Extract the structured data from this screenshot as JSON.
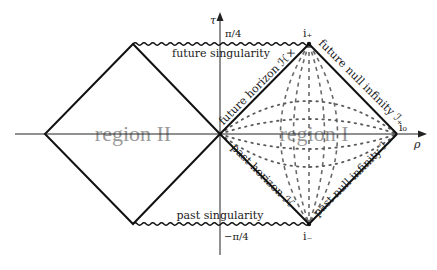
{
  "figure": {
    "axes": {
      "tau_label": "τ",
      "rho_label": "ρ",
      "tau_top_tick": "π/4",
      "tau_bottom_tick": "−π/4"
    },
    "points": {
      "i_plus": "i₊",
      "i_minus": "i₋",
      "i_zero": "i₀"
    },
    "regions": {
      "region_1": "region I",
      "region_2": "region II"
    },
    "singularities": {
      "future": "future singularity",
      "past": "past singularity"
    },
    "boundaries": {
      "future_horizon": "future horizon ℋ×",
      "past_horizon": "past horizon ℋ₋",
      "future_null_infinity": "future null infinity ℐ₊",
      "past_null_infinity": "past null infinity ℐ₋"
    },
    "colors": {
      "lines": "#111111",
      "region_label": "#9a9a9a",
      "coordinate_curves": "#6a6a6a",
      "background": "#ffffff"
    }
  }
}
